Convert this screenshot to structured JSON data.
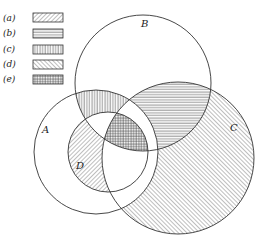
{
  "legend": [
    {
      "key": "(a)",
      "pattern": "diagonal-forward"
    },
    {
      "key": "(b)",
      "pattern": "horizontal"
    },
    {
      "key": "(c)",
      "pattern": "vertical"
    },
    {
      "key": "(d)",
      "pattern": "diagonal-back"
    },
    {
      "key": "(e)",
      "pattern": "crosshatch"
    }
  ],
  "sets": {
    "A": "A",
    "B": "B",
    "C": "C",
    "D": "D"
  },
  "colors": {
    "stroke": "#333333",
    "background": "#ffffff"
  }
}
